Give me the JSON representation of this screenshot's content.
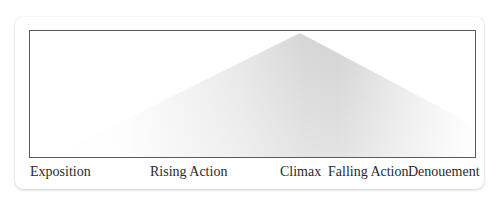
{
  "diagram": {
    "type": "freytag-pyramid",
    "stages": [
      {
        "id": "exposition",
        "label": "Exposition"
      },
      {
        "id": "rising-action",
        "label": "Rising Action"
      },
      {
        "id": "climax",
        "label": "Climax"
      },
      {
        "id": "falling-action",
        "label": "Falling Action"
      },
      {
        "id": "denouement",
        "label": "Denouement"
      }
    ],
    "colors": {
      "frame_border": "#5a5a5a",
      "fill": "#c8c8c8",
      "text": "#2a2a2a",
      "background": "#ffffff"
    }
  }
}
